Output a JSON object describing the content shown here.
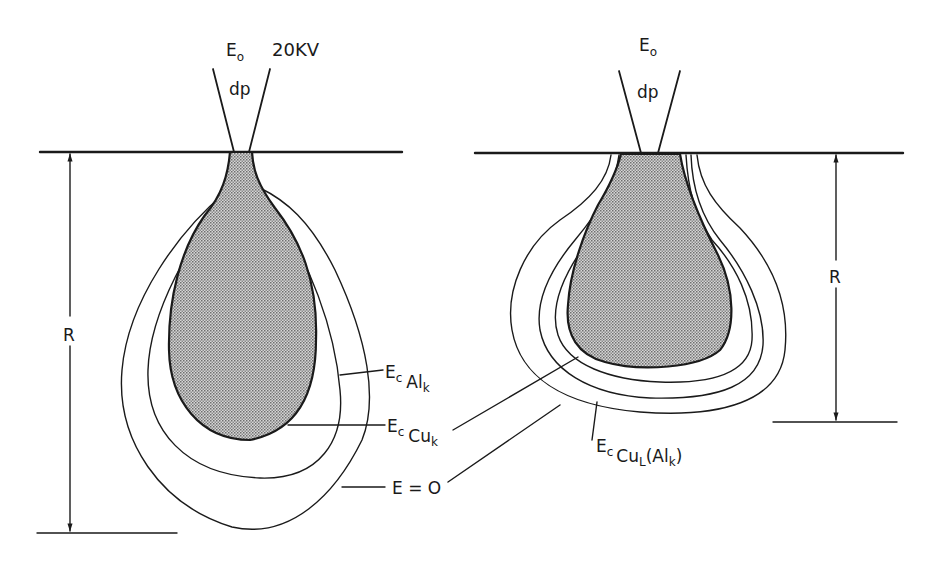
{
  "figure": {
    "title": "20KV",
    "colors": {
      "ink": "#1a1a1a",
      "background": "#ffffff",
      "stipple": "#9a9a9a"
    }
  },
  "left_panel": {
    "beam_label": {
      "main": "E",
      "sub": "o"
    },
    "beam_diameter_label": "dp",
    "range_label": "R",
    "annotations": [
      {
        "id": "ec-alk",
        "main": "E",
        "sub1": "c",
        "sub2": "Al",
        "sub3": "k"
      },
      {
        "id": "ec-cuk",
        "main": "E",
        "sub1": "c",
        "sub2": "Cu",
        "sub3": "k"
      },
      {
        "id": "e-zero",
        "text": "E = O"
      }
    ]
  },
  "right_panel": {
    "beam_label": {
      "main": "E",
      "sub": "o"
    },
    "beam_diameter_label": "dp",
    "range_label": "R",
    "annotations": [
      {
        "id": "ec-cul-alk",
        "main": "E",
        "sub1": "c",
        "sub2": "Cu",
        "sub3": "L",
        "tail": "(Al",
        "sub4": "k",
        "close": ")"
      }
    ]
  }
}
